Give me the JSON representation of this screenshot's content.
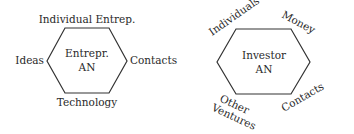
{
  "diagram": {
    "left": {
      "center_line1": "Entrepr.",
      "center_line2": "AN",
      "top": "Individual Entrep.",
      "left": "Ideas",
      "right": "Contacts",
      "bottom": "Technology"
    },
    "right": {
      "center_line1": "Investor",
      "center_line2": "AN",
      "top_left": "Individuals",
      "top_right": "Money",
      "bottom_left_line1": "Other",
      "bottom_left_line2": "Ventures",
      "bottom_right": "Contacts"
    },
    "colors": {
      "stroke": "#333333",
      "text": "#2a2a2a",
      "background": "#ffffff"
    }
  }
}
